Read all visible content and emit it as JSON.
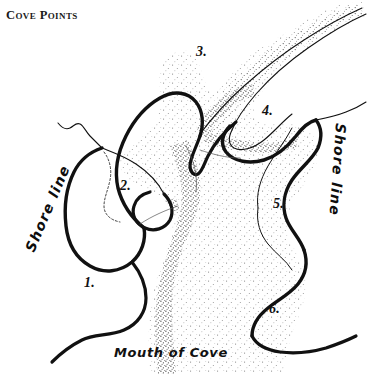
{
  "title": "Cove Points",
  "labels": {
    "shore_line_left": "Shore line",
    "shore_line_right": "Shore line",
    "mouth_of_cove": "Mouth of Cove"
  },
  "points": [
    {
      "id": "1",
      "label": "1.",
      "x": 84,
      "y": 275
    },
    {
      "id": "2",
      "label": "2.",
      "x": 120,
      "y": 178
    },
    {
      "id": "3",
      "label": "3.",
      "x": 196,
      "y": 44
    },
    {
      "id": "4",
      "label": "4.",
      "x": 262,
      "y": 103
    },
    {
      "id": "5",
      "label": "5.",
      "x": 273,
      "y": 196
    },
    {
      "id": "6",
      "label": "6.",
      "x": 269,
      "y": 301
    }
  ],
  "colors": {
    "ink": "#111111",
    "paper": "#ffffff",
    "stipple": "#6b6b6b",
    "dense_stipple": "#2b2b2b"
  }
}
